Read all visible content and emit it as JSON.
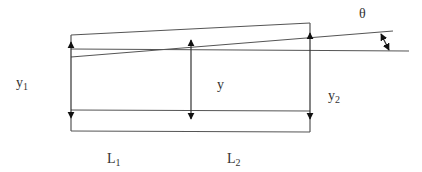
{
  "diagram": {
    "labels": {
      "theta": "θ",
      "y1_main": "y",
      "y1_sub": "1",
      "y": "y",
      "y2_main": "y",
      "y2_sub": "2",
      "L1_main": "L",
      "L1_sub": "1",
      "L2_main": "L",
      "L2_sub": "2"
    },
    "colors": {
      "line": "#555555",
      "text": "#333333"
    }
  }
}
